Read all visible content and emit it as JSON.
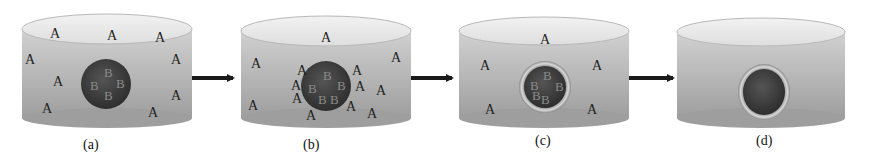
{
  "figure": {
    "arrow_color": "#1a1a1a",
    "container_fill_top": "#c9c9c9",
    "container_fill_bottom": "#9c9c9c",
    "particle_fill": "#3d3d3d",
    "panels": [
      {
        "caption": "(a)",
        "particle_labels": [
          "B",
          "B",
          "B",
          "B"
        ],
        "shell": false,
        "solute_label": "A",
        "solute_count": 11
      },
      {
        "caption": "(b)",
        "particle_labels": [
          "B",
          "B",
          "B",
          "B",
          "B"
        ],
        "shell": false,
        "solute_label": "A",
        "solute_count": 15
      },
      {
        "caption": "(c)",
        "particle_labels": [
          "B",
          "B",
          "B",
          "B",
          "B"
        ],
        "shell": true,
        "solute_label": "A",
        "solute_count": 5
      },
      {
        "caption": "(d)",
        "particle_labels": [],
        "shell": true,
        "solute_label": "A",
        "solute_count": 0
      }
    ]
  }
}
